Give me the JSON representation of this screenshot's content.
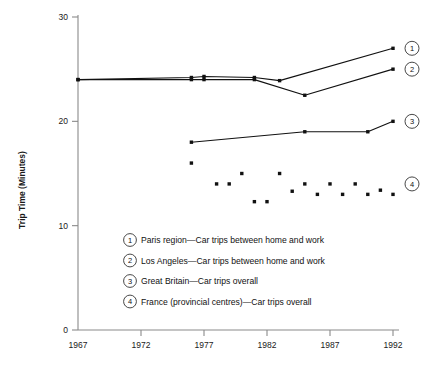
{
  "chart_data": {
    "type": "line",
    "title": "",
    "xlabel": "",
    "ylabel": "Trip Time (Minutes)",
    "xlim": [
      1967,
      1992
    ],
    "ylim": [
      0,
      30
    ],
    "yticks": [
      0,
      10,
      20,
      30
    ],
    "ytick_labels": [
      "0",
      "10",
      "20",
      "30"
    ],
    "xticks": [
      1967,
      1972,
      1977,
      1982,
      1987,
      1992
    ],
    "xtick_labels": [
      "1967",
      "1972",
      "1977",
      "1982",
      "1987",
      "1992"
    ],
    "grid": false,
    "legend_position": "inside-lower-left",
    "series": [
      {
        "id": "1",
        "name": "Paris region—Car trips between home and work",
        "marker": "square",
        "mode": "lines+markers",
        "points": [
          {
            "x": 1967,
            "y": 24.0
          },
          {
            "x": 1976,
            "y": 24.2
          },
          {
            "x": 1977,
            "y": 24.3
          },
          {
            "x": 1981,
            "y": 24.2
          },
          {
            "x": 1983,
            "y": 23.9
          },
          {
            "x": 1992,
            "y": 27.0
          }
        ]
      },
      {
        "id": "2",
        "name": "Los Angeles—Car trips between home and work",
        "marker": "square",
        "mode": "lines+markers",
        "points": [
          {
            "x": 1967,
            "y": 24.0
          },
          {
            "x": 1976,
            "y": 24.0
          },
          {
            "x": 1977,
            "y": 24.0
          },
          {
            "x": 1981,
            "y": 24.0
          },
          {
            "x": 1985,
            "y": 22.5
          },
          {
            "x": 1992,
            "y": 25.0
          }
        ]
      },
      {
        "id": "3",
        "name": "Great Britain—Car trips overall",
        "marker": "square",
        "mode": "lines+markers",
        "points": [
          {
            "x": 1976,
            "y": 18.0
          },
          {
            "x": 1985,
            "y": 19.0
          },
          {
            "x": 1990,
            "y": 19.0
          },
          {
            "x": 1992,
            "y": 20.0
          }
        ]
      },
      {
        "id": "4",
        "name": "France (provincial centres)—Car trips overall",
        "marker": "square",
        "mode": "markers",
        "points": [
          {
            "x": 1976,
            "y": 16.0
          },
          {
            "x": 1978,
            "y": 14.0
          },
          {
            "x": 1979,
            "y": 14.0
          },
          {
            "x": 1980,
            "y": 15.0
          },
          {
            "x": 1981,
            "y": 12.3
          },
          {
            "x": 1982,
            "y": 12.3
          },
          {
            "x": 1983,
            "y": 15.0
          },
          {
            "x": 1984,
            "y": 13.3
          },
          {
            "x": 1985,
            "y": 14.0
          },
          {
            "x": 1986,
            "y": 13.0
          },
          {
            "x": 1987,
            "y": 14.0
          },
          {
            "x": 1988,
            "y": 13.0
          },
          {
            "x": 1989,
            "y": 14.0
          },
          {
            "x": 1990,
            "y": 13.0
          },
          {
            "x": 1991,
            "y": 13.4
          },
          {
            "x": 1992,
            "y": 13.0
          }
        ]
      }
    ],
    "callouts": [
      {
        "id": "1",
        "label": "1",
        "y": 27.0
      },
      {
        "id": "2",
        "label": "2",
        "y": 25.0
      },
      {
        "id": "3",
        "label": "3",
        "y": 20.0
      },
      {
        "id": "4",
        "label": "4",
        "y": 14.0
      }
    ],
    "legend": [
      {
        "num": "1",
        "text": "Paris region—Car trips between home and work"
      },
      {
        "num": "2",
        "text": "Los Angeles—Car trips between home and work"
      },
      {
        "num": "3",
        "text": "Great Britain—Car trips overall"
      },
      {
        "num": "4",
        "text": "France (provincial centres)—Car trips overall"
      }
    ],
    "colors": {
      "line": "#111111",
      "marker": "#111111",
      "axis": "#8a8a8a",
      "text": "#111111",
      "background": "#ffffff"
    }
  }
}
